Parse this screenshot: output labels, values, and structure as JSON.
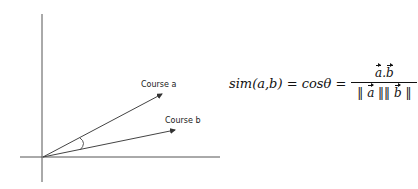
{
  "diagram": {
    "vectors": [
      {
        "label": "Course a"
      },
      {
        "label": "Course b"
      }
    ],
    "angle_symbol": "θ"
  },
  "formula": {
    "lhs": "sim(a,b) = cosθ =",
    "numerator_a": "a",
    "numerator_sep": ".",
    "numerator_b": "b",
    "den_open": "‖",
    "den_a": "a",
    "den_mid": "‖‖",
    "den_b": "b",
    "den_close": "‖"
  }
}
